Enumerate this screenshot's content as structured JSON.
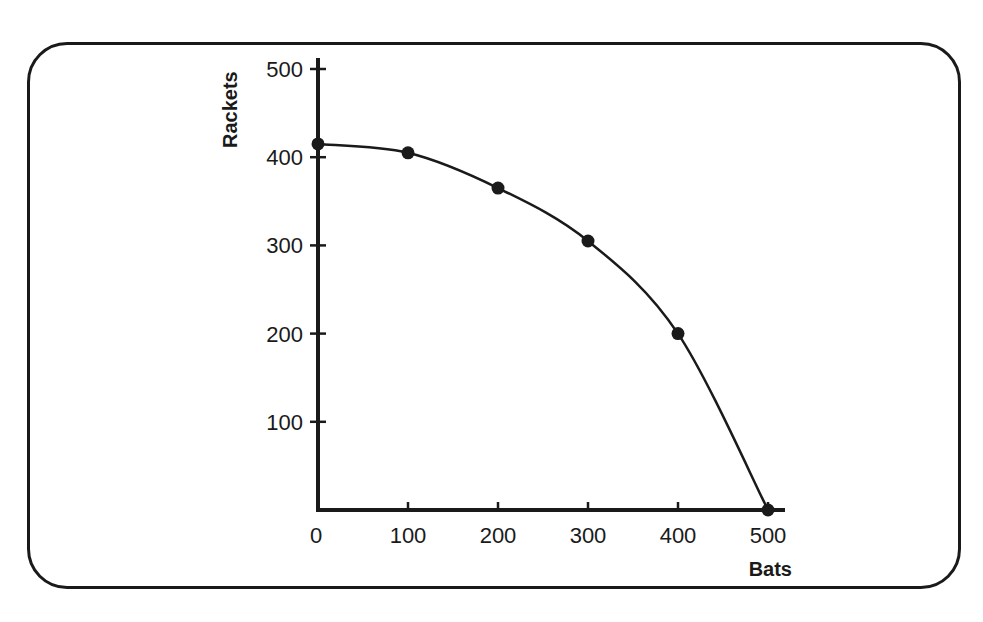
{
  "chart_data": {
    "type": "line",
    "title": "",
    "xlabel": "Bats",
    "ylabel": "Rackets",
    "x": [
      0,
      100,
      200,
      300,
      400,
      500
    ],
    "series": [
      {
        "name": "Production possibilities frontier",
        "values": [
          415,
          405,
          365,
          305,
          200,
          0
        ]
      }
    ],
    "x_ticks": [
      "0",
      "100",
      "200",
      "300",
      "400",
      "500"
    ],
    "y_ticks": [
      "100",
      "200",
      "300",
      "400",
      "500"
    ],
    "xlim": [
      0,
      500
    ],
    "ylim": [
      0,
      500
    ],
    "grid": false,
    "legend": "none",
    "markers": true
  },
  "colors": {
    "ink": "#1a1a1a",
    "background": "#ffffff"
  }
}
